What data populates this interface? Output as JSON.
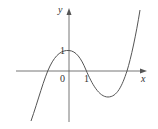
{
  "diagram": {
    "type": "function-graph",
    "axes": {
      "x_label": "x",
      "y_label": "y",
      "origin_label": "0",
      "x_tick_label": "1",
      "y_tick_label": "1"
    },
    "curve": {
      "description": "cubic polynomial with local max at (0,1) and local min near x≈2.3",
      "color": "#555555"
    },
    "colors": {
      "axis": "#666666",
      "curve": "#555555",
      "text": "#333333"
    }
  }
}
